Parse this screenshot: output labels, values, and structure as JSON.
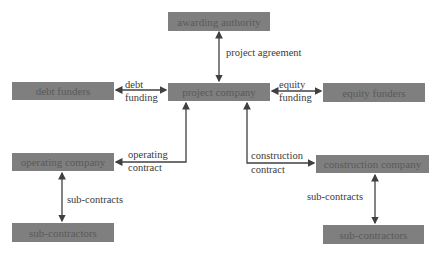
{
  "diagram": {
    "nodes": {
      "awarding_authority": "awarding authority",
      "debt_funders": "debt funders",
      "project_company": "project company",
      "equity_funders": "equity funders",
      "operating_company": "operating company",
      "construction_company": "construction company",
      "sub_contractors_left": "sub-contractors",
      "sub_contractors_right": "sub-contractors"
    },
    "edges": {
      "project_agreement": "project agreement",
      "debt_line1": "debt",
      "debt_line2": "funding",
      "equity_line1": "equity",
      "equity_line2": "funding",
      "operating_line1": "operating",
      "operating_line2": "contract",
      "construction_line1": "construction",
      "construction_line2": "contract",
      "subcontracts_left": "sub-contracts",
      "subcontracts_right": "sub-contracts"
    },
    "colors": {
      "box_fill": "#7f7f7f",
      "box_text": "#5a5a5a",
      "line": "#404040"
    }
  }
}
